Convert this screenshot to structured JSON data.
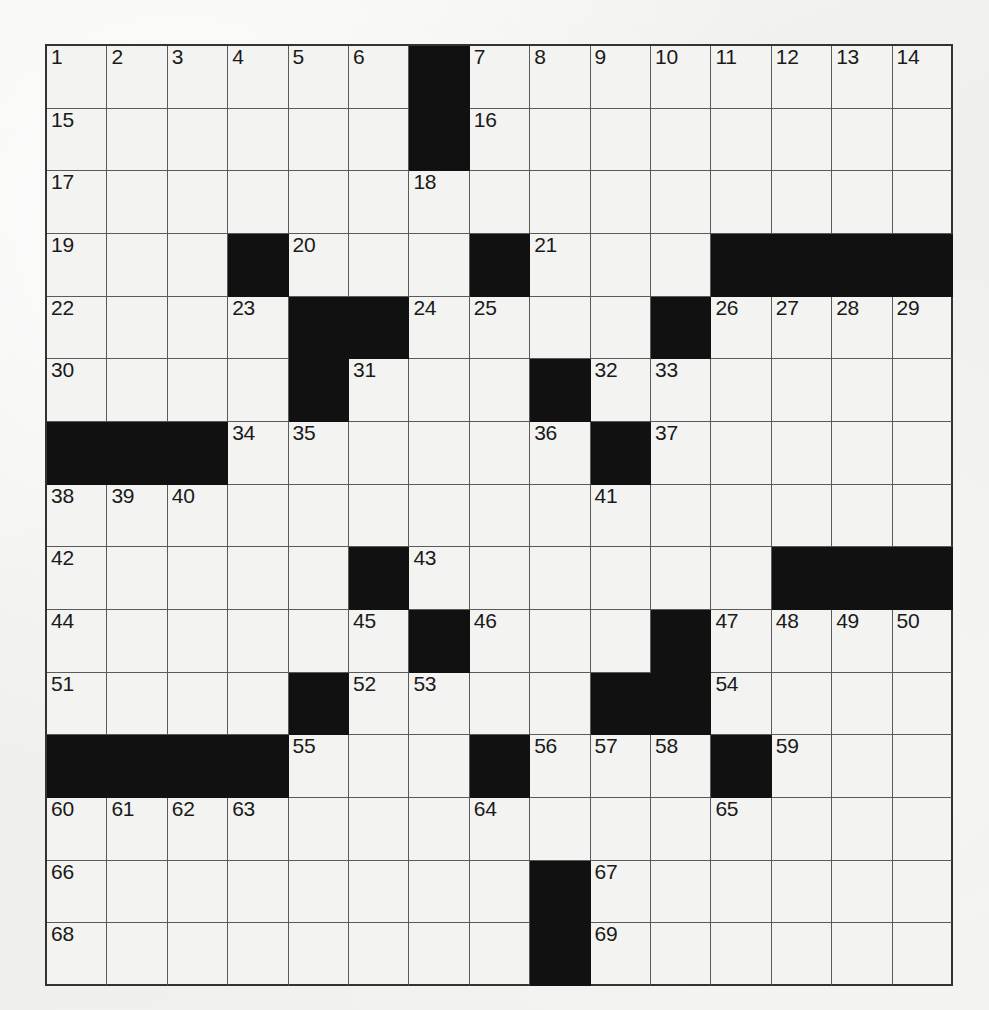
{
  "puzzle": {
    "title": "Crossword Puzzle Grid",
    "rows": 15,
    "cols": 15,
    "colors": {
      "page_background": "#f2f2f0",
      "cell_background": "#f3f3f1",
      "block_color": "#111111",
      "grid_line": "#5a5a5a",
      "border": "#333333",
      "number_color": "#1a1a1a"
    },
    "blocks": [
      [
        0,
        6
      ],
      [
        1,
        6
      ],
      [
        3,
        3
      ],
      [
        3,
        7
      ],
      [
        3,
        11
      ],
      [
        3,
        12
      ],
      [
        3,
        13
      ],
      [
        3,
        14
      ],
      [
        4,
        4
      ],
      [
        4,
        5
      ],
      [
        4,
        10
      ],
      [
        5,
        4
      ],
      [
        5,
        8
      ],
      [
        6,
        0
      ],
      [
        6,
        1
      ],
      [
        6,
        2
      ],
      [
        6,
        9
      ],
      [
        8,
        5
      ],
      [
        8,
        12
      ],
      [
        8,
        13
      ],
      [
        8,
        14
      ],
      [
        9,
        6
      ],
      [
        9,
        10
      ],
      [
        10,
        4
      ],
      [
        10,
        9
      ],
      [
        10,
        10
      ],
      [
        11,
        0
      ],
      [
        11,
        1
      ],
      [
        11,
        2
      ],
      [
        11,
        3
      ],
      [
        11,
        7
      ],
      [
        11,
        11
      ],
      [
        13,
        8
      ],
      [
        14,
        8
      ]
    ],
    "numbers": [
      {
        "row": 0,
        "col": 0,
        "n": "1"
      },
      {
        "row": 0,
        "col": 1,
        "n": "2"
      },
      {
        "row": 0,
        "col": 2,
        "n": "3"
      },
      {
        "row": 0,
        "col": 3,
        "n": "4"
      },
      {
        "row": 0,
        "col": 4,
        "n": "5"
      },
      {
        "row": 0,
        "col": 5,
        "n": "6"
      },
      {
        "row": 0,
        "col": 7,
        "n": "7"
      },
      {
        "row": 0,
        "col": 8,
        "n": "8"
      },
      {
        "row": 0,
        "col": 9,
        "n": "9"
      },
      {
        "row": 0,
        "col": 10,
        "n": "10"
      },
      {
        "row": 0,
        "col": 11,
        "n": "11"
      },
      {
        "row": 0,
        "col": 12,
        "n": "12"
      },
      {
        "row": 0,
        "col": 13,
        "n": "13"
      },
      {
        "row": 0,
        "col": 14,
        "n": "14"
      },
      {
        "row": 1,
        "col": 0,
        "n": "15"
      },
      {
        "row": 1,
        "col": 7,
        "n": "16"
      },
      {
        "row": 2,
        "col": 0,
        "n": "17"
      },
      {
        "row": 2,
        "col": 6,
        "n": "18"
      },
      {
        "row": 3,
        "col": 0,
        "n": "19"
      },
      {
        "row": 3,
        "col": 4,
        "n": "20"
      },
      {
        "row": 3,
        "col": 8,
        "n": "21"
      },
      {
        "row": 4,
        "col": 0,
        "n": "22"
      },
      {
        "row": 4,
        "col": 3,
        "n": "23"
      },
      {
        "row": 4,
        "col": 6,
        "n": "24"
      },
      {
        "row": 4,
        "col": 7,
        "n": "25"
      },
      {
        "row": 4,
        "col": 11,
        "n": "26"
      },
      {
        "row": 4,
        "col": 12,
        "n": "27"
      },
      {
        "row": 4,
        "col": 13,
        "n": "28"
      },
      {
        "row": 4,
        "col": 14,
        "n": "29"
      },
      {
        "row": 5,
        "col": 0,
        "n": "30"
      },
      {
        "row": 5,
        "col": 5,
        "n": "31"
      },
      {
        "row": 5,
        "col": 9,
        "n": "32"
      },
      {
        "row": 5,
        "col": 10,
        "n": "33"
      },
      {
        "row": 6,
        "col": 3,
        "n": "34"
      },
      {
        "row": 6,
        "col": 4,
        "n": "35"
      },
      {
        "row": 6,
        "col": 8,
        "n": "36"
      },
      {
        "row": 6,
        "col": 10,
        "n": "37"
      },
      {
        "row": 7,
        "col": 0,
        "n": "38"
      },
      {
        "row": 7,
        "col": 1,
        "n": "39"
      },
      {
        "row": 7,
        "col": 2,
        "n": "40"
      },
      {
        "row": 7,
        "col": 9,
        "n": "41"
      },
      {
        "row": 8,
        "col": 0,
        "n": "42"
      },
      {
        "row": 8,
        "col": 6,
        "n": "43"
      },
      {
        "row": 9,
        "col": 0,
        "n": "44"
      },
      {
        "row": 9,
        "col": 5,
        "n": "45"
      },
      {
        "row": 9,
        "col": 7,
        "n": "46"
      },
      {
        "row": 9,
        "col": 11,
        "n": "47"
      },
      {
        "row": 9,
        "col": 12,
        "n": "48"
      },
      {
        "row": 9,
        "col": 13,
        "n": "49"
      },
      {
        "row": 9,
        "col": 14,
        "n": "50"
      },
      {
        "row": 10,
        "col": 0,
        "n": "51"
      },
      {
        "row": 10,
        "col": 5,
        "n": "52"
      },
      {
        "row": 10,
        "col": 6,
        "n": "53"
      },
      {
        "row": 10,
        "col": 11,
        "n": "54"
      },
      {
        "row": 11,
        "col": 4,
        "n": "55"
      },
      {
        "row": 11,
        "col": 8,
        "n": "56"
      },
      {
        "row": 11,
        "col": 9,
        "n": "57"
      },
      {
        "row": 11,
        "col": 10,
        "n": "58"
      },
      {
        "row": 11,
        "col": 12,
        "n": "59"
      },
      {
        "row": 12,
        "col": 0,
        "n": "60"
      },
      {
        "row": 12,
        "col": 1,
        "n": "61"
      },
      {
        "row": 12,
        "col": 2,
        "n": "62"
      },
      {
        "row": 12,
        "col": 3,
        "n": "63"
      },
      {
        "row": 12,
        "col": 7,
        "n": "64"
      },
      {
        "row": 12,
        "col": 11,
        "n": "65"
      },
      {
        "row": 13,
        "col": 0,
        "n": "66"
      },
      {
        "row": 13,
        "col": 9,
        "n": "67"
      },
      {
        "row": 14,
        "col": 0,
        "n": "68"
      },
      {
        "row": 14,
        "col": 9,
        "n": "69"
      }
    ],
    "letters": []
  }
}
